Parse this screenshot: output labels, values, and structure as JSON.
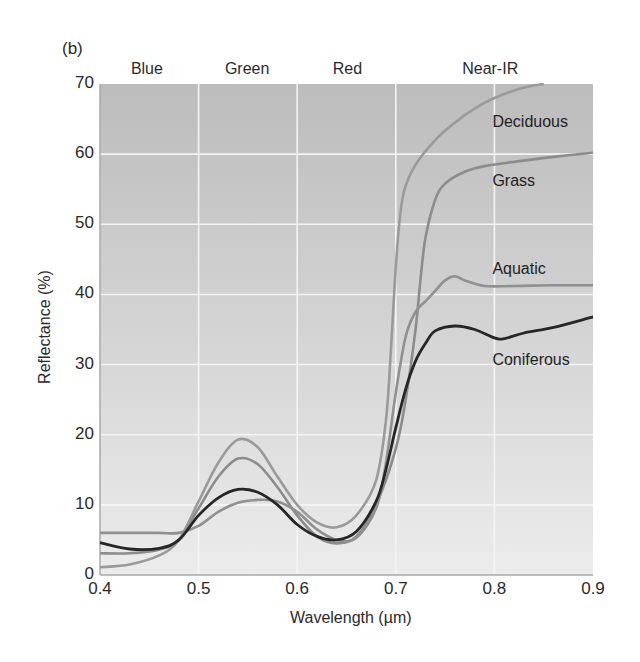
{
  "panel_label": "(b)",
  "chart_data": {
    "type": "line",
    "title": "",
    "xlabel": "Wavelength (µm)",
    "ylabel": "Reflectance (%)",
    "xlim": [
      0.4,
      0.9
    ],
    "ylim": [
      0,
      70
    ],
    "x_ticks": [
      "0.4",
      "0.5",
      "0.6",
      "0.7",
      "0.8",
      "0.9"
    ],
    "y_ticks": [
      "0",
      "10",
      "20",
      "30",
      "40",
      "50",
      "60",
      "70"
    ],
    "grid": true,
    "background": "gradient gray (darker at top, lighter at bottom)",
    "band_labels": [
      {
        "name": "Blue",
        "x": 0.45
      },
      {
        "name": "Green",
        "x": 0.55
      },
      {
        "name": "Red",
        "x": 0.65
      },
      {
        "name": "Near-IR",
        "x": 0.8
      }
    ],
    "series": [
      {
        "name": "Deciduous",
        "color": "#9a9a9a",
        "x": [
          0.4,
          0.43,
          0.46,
          0.48,
          0.5,
          0.52,
          0.54,
          0.56,
          0.58,
          0.6,
          0.62,
          0.64,
          0.66,
          0.68,
          0.69,
          0.695,
          0.7,
          0.705,
          0.71,
          0.72,
          0.74,
          0.76,
          0.78,
          0.8,
          0.83,
          0.85
        ],
        "values": [
          1.1,
          1.5,
          2.8,
          5.0,
          10.5,
          16.0,
          19.3,
          18.2,
          14.0,
          10.0,
          7.5,
          6.8,
          8.5,
          13.5,
          22.0,
          32.0,
          44.0,
          52.0,
          55.5,
          58.5,
          62.0,
          64.5,
          66.5,
          68.0,
          69.5,
          70.0
        ]
      },
      {
        "name": "Grass",
        "color": "#8c8c8c",
        "x": [
          0.4,
          0.43,
          0.46,
          0.48,
          0.5,
          0.52,
          0.54,
          0.56,
          0.58,
          0.6,
          0.62,
          0.64,
          0.66,
          0.68,
          0.7,
          0.71,
          0.72,
          0.725,
          0.73,
          0.74,
          0.75,
          0.77,
          0.79,
          0.82,
          0.86,
          0.9
        ],
        "values": [
          3.1,
          3.1,
          3.6,
          5.0,
          9.5,
          14.0,
          16.6,
          15.8,
          12.5,
          8.5,
          5.5,
          4.5,
          5.5,
          10.0,
          18.0,
          25.0,
          35.0,
          42.0,
          48.0,
          53.5,
          55.8,
          57.5,
          58.3,
          58.9,
          59.6,
          60.2
        ]
      },
      {
        "name": "Aquatic",
        "color": "#909090",
        "x": [
          0.4,
          0.43,
          0.46,
          0.48,
          0.5,
          0.52,
          0.54,
          0.56,
          0.58,
          0.6,
          0.62,
          0.64,
          0.66,
          0.68,
          0.69,
          0.7,
          0.71,
          0.72,
          0.73,
          0.74,
          0.75,
          0.76,
          0.77,
          0.79,
          0.82,
          0.86,
          0.9
        ],
        "values": [
          6.0,
          6.0,
          6.0,
          6.0,
          7.0,
          9.0,
          10.3,
          10.7,
          10.5,
          9.0,
          6.5,
          5.0,
          5.3,
          9.5,
          16.0,
          26.0,
          34.0,
          37.5,
          39.0,
          40.5,
          42.0,
          42.6,
          42.0,
          41.2,
          41.2,
          41.3,
          41.3
        ]
      },
      {
        "name": "Coniferous",
        "color": "#262626",
        "x": [
          0.4,
          0.43,
          0.46,
          0.48,
          0.5,
          0.52,
          0.54,
          0.56,
          0.58,
          0.6,
          0.62,
          0.64,
          0.66,
          0.68,
          0.69,
          0.7,
          0.71,
          0.72,
          0.73,
          0.74,
          0.76,
          0.78,
          0.8,
          0.81,
          0.83,
          0.86,
          0.9
        ],
        "values": [
          4.6,
          3.7,
          3.8,
          5.0,
          8.5,
          11.0,
          12.2,
          11.8,
          10.0,
          7.2,
          5.5,
          5.0,
          6.2,
          10.5,
          15.0,
          21.0,
          26.5,
          30.5,
          33.0,
          34.8,
          35.5,
          35.0,
          33.8,
          33.7,
          34.5,
          35.3,
          36.8
        ]
      }
    ],
    "series_labels": [
      {
        "name": "Deciduous",
        "x": 0.8,
        "y": 64.5
      },
      {
        "name": "Grass",
        "x": 0.8,
        "y": 56.0
      },
      {
        "name": "Aquatic",
        "x": 0.8,
        "y": 43.5
      },
      {
        "name": "Coniferous",
        "x": 0.8,
        "y": 30.5
      }
    ]
  }
}
